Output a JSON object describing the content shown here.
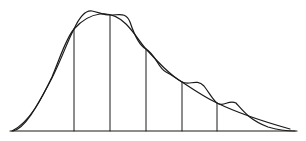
{
  "diagram": {
    "stroke_color": "#1a1a1a",
    "background": "#ffffff",
    "baseline": {
      "x1": 10,
      "x2": 297,
      "y": 131
    },
    "knots": [
      {
        "x": 74,
        "y": 29
      },
      {
        "x": 110,
        "y": 15
      },
      {
        "x": 146,
        "y": 49
      },
      {
        "x": 182,
        "y": 82
      },
      {
        "x": 217,
        "y": 103
      }
    ],
    "smooth_curve_label": "",
    "wavy_curve_label": ""
  }
}
